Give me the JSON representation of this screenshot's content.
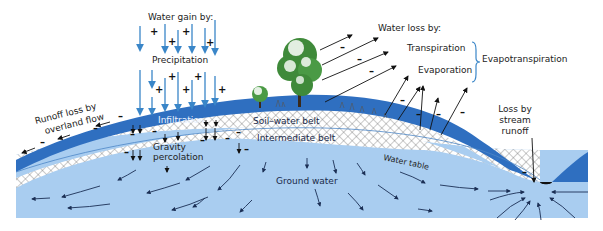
{
  "diagram": {
    "type": "hydrologic-cycle-cross-section",
    "colors": {
      "soil_water_belt": "#2f6fc0",
      "intermediate_belt_hatch": "#555555",
      "ground_water": "#a9cdf0",
      "precip_arrows": "#3a86c8",
      "loss_arrows": "#111111",
      "tree_green": "#3f8a3a"
    },
    "labels": {
      "water_gain_by": "Water gain by:",
      "precipitation": "Precipitation",
      "infiltration": "Infiltration",
      "runoff_loss_line1": "Runoff loss by",
      "runoff_loss_line2": "overland flow",
      "gravity_line1": "Gravity",
      "gravity_line2": "percolation",
      "soil_water_belt": "Soil–water belt",
      "intermediate_belt": "Intermediate belt",
      "ground_water": "Ground water",
      "water_table": "Water table",
      "water_loss_by": "Water loss by:",
      "transpiration": "Transpiration",
      "evaporation": "Evaporation",
      "evapotranspiration": "Evapotranspiration",
      "stream_loss_line1": "Loss by",
      "stream_loss_line2": "stream",
      "stream_loss_line3": "runoff"
    },
    "signs": {
      "gain": "+",
      "loss": "–"
    }
  }
}
